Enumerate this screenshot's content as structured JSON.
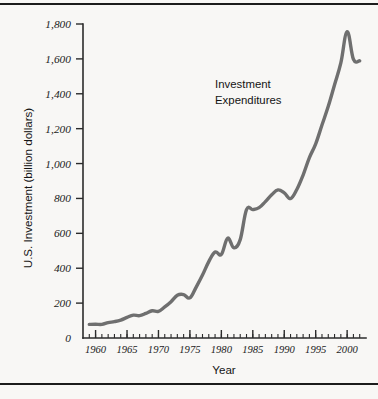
{
  "figure": {
    "background_color": "#f8f7f5",
    "line_color": "#6f6f6f",
    "axis_color": "#2b2b2b",
    "rule_color": "#1c1c1c"
  },
  "annotation": {
    "line1": "Investment",
    "line2": "Expenditures"
  },
  "chart_data": {
    "type": "line",
    "title": "",
    "subtitle": "",
    "xlabel": "Year",
    "ylabel": "U.S. Investment (billion dollars)",
    "xlim": [
      1958,
      2003
    ],
    "ylim": [
      0,
      1800
    ],
    "grid": false,
    "legend": "inline-annotation",
    "legend_position": "upper-center-right",
    "x_major_ticks": [
      1960,
      1965,
      1970,
      1975,
      1980,
      1985,
      1990,
      1995,
      2000
    ],
    "x_tick_labels": [
      "1960",
      "1965",
      "1970",
      "1975",
      "1980",
      "1985",
      "1990",
      "1995",
      "2000"
    ],
    "x_minor_tick_interval": 1,
    "y_major_ticks": [
      0,
      200,
      400,
      600,
      800,
      1000,
      1200,
      1400,
      1600,
      1800
    ],
    "y_tick_labels": [
      "0",
      "200",
      "400",
      "600",
      "800",
      "1,000",
      "1,200",
      "1,400",
      "1,600",
      "1,800"
    ],
    "series": [
      {
        "name": "Investment Expenditures",
        "color": "#6f6f6f",
        "x": [
          1959,
          1960,
          1961,
          1962,
          1963,
          1964,
          1965,
          1966,
          1967,
          1968,
          1969,
          1970,
          1971,
          1972,
          1973,
          1974,
          1975,
          1976,
          1977,
          1978,
          1979,
          1980,
          1981,
          1982,
          1983,
          1984,
          1985,
          1986,
          1987,
          1988,
          1989,
          1990,
          1991,
          1992,
          1993,
          1994,
          1995,
          1996,
          1997,
          1998,
          1999,
          2000,
          2001,
          2002
        ],
        "values": [
          78,
          79,
          78,
          88,
          94,
          103,
          118,
          131,
          128,
          141,
          156,
          153,
          178,
          208,
          245,
          249,
          230,
          292,
          361,
          438,
          493,
          479,
          572,
          517,
          564,
          736,
          736,
          747,
          782,
          821,
          849,
          832,
          799,
          851,
          934,
          1034,
          1113,
          1221,
          1328,
          1452,
          1577,
          1756,
          1598,
          1589
        ]
      }
    ]
  }
}
